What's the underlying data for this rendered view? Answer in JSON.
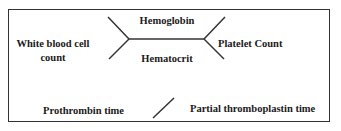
{
  "diagram": {
    "type": "fishbone-lab-shorthand",
    "cbc": {
      "top": "Hemoglobin",
      "bottom": "Hematocrit",
      "left_line1": "White blood cell",
      "left_line2": "count",
      "right": "Platelet Count"
    },
    "coagulation": {
      "left": "Prothrombin time",
      "right": "Partial thromboplastin time"
    },
    "colors": {
      "line": "#333333",
      "text": "#1a1a1a"
    }
  }
}
